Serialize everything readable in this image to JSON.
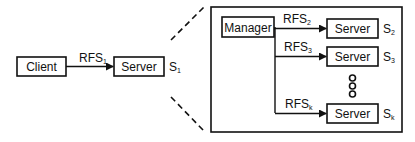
{
  "diagram": {
    "client": {
      "label": "Client"
    },
    "server_main": {
      "label": "Server",
      "id_base": "S",
      "id_sub": "1"
    },
    "link_client_server": {
      "label_base": "RFS",
      "label_sub": "1"
    },
    "expanded": {
      "manager": {
        "label": "Manager"
      },
      "servers": [
        {
          "label": "Server",
          "id_base": "S",
          "id_sub": "2",
          "link_base": "RFS",
          "link_sub": "2"
        },
        {
          "label": "Server",
          "id_base": "S",
          "id_sub": "3",
          "link_base": "RFS",
          "link_sub": "3"
        },
        {
          "label": "Server",
          "id_base": "S",
          "id_sub": "k",
          "link_base": "RFS",
          "link_sub": "k"
        }
      ],
      "ellipsis": "vertical-circles"
    },
    "colors": {
      "stroke": "#111111",
      "background": "#ffffff"
    }
  }
}
